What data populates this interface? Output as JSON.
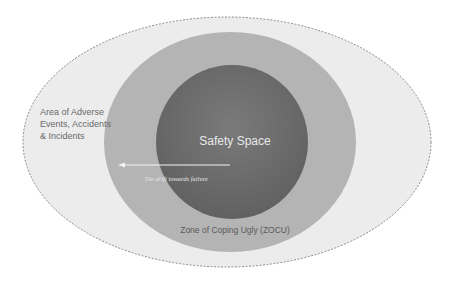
{
  "diagram": {
    "zones": [
      {
        "id": "outer",
        "label": "Area of Adverse Events, Accidents & Incidents",
        "label_lines": [
          "Area of Adverse",
          "Events, Accidents",
          "& Incidents"
        ],
        "fill": "#ececec",
        "stroke": "#8a8a8a"
      },
      {
        "id": "middle",
        "label": "Zone of Coping Ugly (ZOCU)",
        "fill": "#b4b4b4"
      },
      {
        "id": "inner",
        "label": "Safety Space",
        "fill": "#6e6e6e"
      }
    ],
    "arrow": {
      "label": "The drift towards failure",
      "direction": "left",
      "color": "#f4f4f4"
    },
    "text_colors": {
      "outer_label": "#6a6a6a",
      "middle_label": "#5a5a5a",
      "inner_label": "#e8e8e8",
      "arrow_label": "#e6e6e6"
    }
  }
}
